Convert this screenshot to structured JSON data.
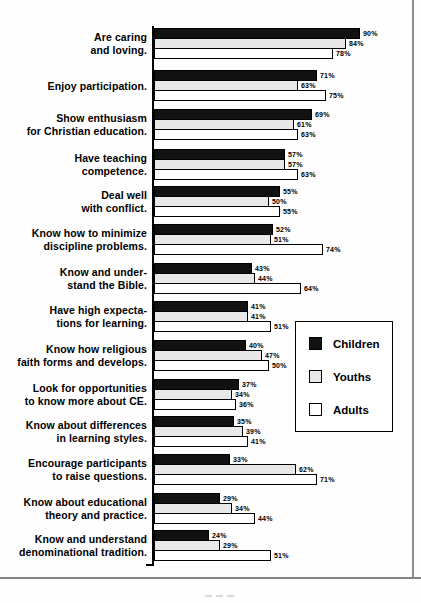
{
  "chart_data": {
    "type": "bar",
    "orientation": "horizontal",
    "title": "",
    "xlabel": "",
    "ylabel": "",
    "xlim": [
      0,
      100
    ],
    "value_suffix": "%",
    "grid": false,
    "legend_position": "middle-right",
    "categories": [
      "Are caring and loving.",
      "Enjoy participation.",
      "Show enthusiasm for Christian education.",
      "Have teaching competence.",
      "Deal well with conflict.",
      "Know how to minimize discipline problems.",
      "Know and under- stand the Bible.",
      "Have high expecta- tions for learning.",
      "Know how religious faith forms and develops.",
      "Look for opportunities to know more about CE.",
      "Know about differences in learning styles.",
      "Encourage participants to raise questions.",
      "Know about educational theory and practice.",
      "Know and understand denominational tradition."
    ],
    "category_label_lines": [
      [
        "Are caring",
        "and loving."
      ],
      [
        "Enjoy participation."
      ],
      [
        "Show enthusiasm",
        "for Christian education."
      ],
      [
        "Have teaching",
        "competence."
      ],
      [
        "Deal well",
        "with conflict."
      ],
      [
        "Know how to minimize",
        "discipline problems."
      ],
      [
        "Know and under-",
        "stand the Bible."
      ],
      [
        "Have high expecta-",
        "tions for learning."
      ],
      [
        "Know how religious",
        "faith forms and develops."
      ],
      [
        "Look for opportunities",
        "to know more about CE."
      ],
      [
        "Know about differences",
        "in learning styles."
      ],
      [
        "Encourage participants",
        "to raise questions."
      ],
      [
        "Know about educational",
        "theory and practice."
      ],
      [
        "Know and understand",
        "denominational tradition."
      ]
    ],
    "series": [
      {
        "name": "Children",
        "color": "#111111",
        "values": [
          90,
          71,
          69,
          57,
          55,
          52,
          43,
          41,
          40,
          37,
          35,
          33,
          29,
          24
        ]
      },
      {
        "name": "Youths",
        "color": "#e8e8e8",
        "values": [
          84,
          63,
          61,
          57,
          50,
          51,
          44,
          41,
          47,
          34,
          39,
          62,
          34,
          29
        ]
      },
      {
        "name": "Adults",
        "color": "#ffffff",
        "values": [
          78,
          75,
          63,
          63,
          55,
          74,
          64,
          51,
          50,
          36,
          41,
          71,
          44,
          51
        ]
      }
    ]
  }
}
